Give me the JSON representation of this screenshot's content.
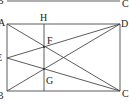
{
  "figure": {
    "type": "geometry-diagram",
    "top_fragment": {
      "left_label": "B",
      "right_label": "C",
      "line": [
        [
          7,
          1
        ],
        [
          120,
          1
        ]
      ]
    },
    "points": {
      "A": {
        "label": "A",
        "x": 7,
        "y": 24
      },
      "D": {
        "label": "D",
        "x": 120,
        "y": 24
      },
      "C": {
        "label": "C",
        "x": 120,
        "y": 91
      },
      "B": {
        "label": "B",
        "x": 7,
        "y": 91
      },
      "E": {
        "label": "E",
        "x": 7,
        "y": 58
      },
      "H": {
        "label": "H",
        "x": 44,
        "y": 24
      },
      "F": {
        "label": "F",
        "x": 44,
        "y": 47
      },
      "G": {
        "label": "G",
        "x": 44,
        "y": 69
      }
    },
    "segments": [
      {
        "name": "AD",
        "from": "A",
        "to": "D"
      },
      {
        "name": "DC",
        "from": "D",
        "to": "C"
      },
      {
        "name": "CB",
        "from": "C",
        "to": "B"
      },
      {
        "name": "BA",
        "from": "B",
        "to": "A"
      },
      {
        "name": "AC",
        "from": "A",
        "to": "C"
      },
      {
        "name": "BD",
        "from": "B",
        "to": "D"
      },
      {
        "name": "ED",
        "from": "E",
        "to": "D"
      },
      {
        "name": "EC",
        "from": "E",
        "to": "C"
      },
      {
        "name": "H-bottom",
        "from": "H",
        "to": "bottom"
      }
    ],
    "labels": {
      "A": "A",
      "B": "B",
      "C": "C",
      "D": "D",
      "E": "E",
      "F": "F",
      "G": "G",
      "H": "H",
      "top_B": "B",
      "top_C": "C"
    }
  }
}
